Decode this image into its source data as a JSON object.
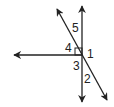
{
  "diagram": {
    "stroke_color": "#222222",
    "background": "#ffffff",
    "lines": [
      {
        "name": "vertical-line",
        "x1": 82,
        "y1": 6,
        "x2": 82,
        "y2": 102,
        "arrows": "both"
      },
      {
        "name": "horizontal-ray",
        "x1": 82,
        "y1": 55,
        "x2": 14,
        "y2": 55,
        "arrows": "end"
      },
      {
        "name": "diagonal-line",
        "x1": 57,
        "y1": 9,
        "x2": 107,
        "y2": 100,
        "arrows": "both"
      }
    ],
    "right_angle_marker": {
      "x": 75,
      "y": 48,
      "size": 7
    },
    "angle_labels": [
      {
        "id": "5",
        "text": "5",
        "x": 72,
        "y": 32
      },
      {
        "id": "4",
        "text": "4",
        "x": 65,
        "y": 52
      },
      {
        "id": "1",
        "text": "1",
        "x": 87,
        "y": 57
      },
      {
        "id": "3",
        "text": "3",
        "x": 73,
        "y": 70
      },
      {
        "id": "2",
        "text": "2",
        "x": 84,
        "y": 83
      }
    ]
  }
}
